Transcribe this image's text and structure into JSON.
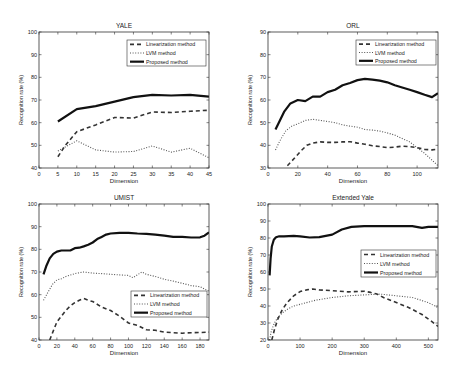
{
  "figure": {
    "legend_labels": [
      "Linearization method",
      "LVM method",
      "Proposed method"
    ],
    "ylabel": "Recognition rate (%)",
    "xlabel": "Dimension"
  },
  "chart_data": [
    {
      "type": "line",
      "title": "YALE",
      "xlabel": "Dimension",
      "ylabel": "Recognition rate (%)",
      "xlim": [
        0,
        45
      ],
      "ylim": [
        40,
        100
      ],
      "xticks": [
        0,
        5,
        10,
        15,
        20,
        25,
        30,
        35,
        40,
        45
      ],
      "yticks": [
        40,
        50,
        60,
        70,
        80,
        90,
        100
      ],
      "grid": false,
      "legend_position": "upper right",
      "box": {
        "left": 39,
        "top": 32,
        "right": 209,
        "bottom": 168
      },
      "legend_box": {
        "x": 127,
        "y": 40,
        "w": 79,
        "h": 26
      },
      "series": [
        {
          "name": "Linearization method",
          "style": "dashed",
          "x": [
            5,
            7,
            10,
            15,
            20,
            25,
            30,
            35,
            40,
            45
          ],
          "y": [
            45,
            50,
            56,
            59,
            62.3,
            62,
            64.7,
            64.5,
            65,
            65.5
          ]
        },
        {
          "name": "LVM method",
          "style": "dotted",
          "x": [
            5,
            10,
            15,
            20,
            25,
            30,
            35,
            40,
            45
          ],
          "y": [
            47.5,
            52,
            48,
            47,
            47.3,
            49.7,
            47,
            48.7,
            44.5
          ]
        },
        {
          "name": "Proposed method",
          "style": "solid",
          "x": [
            5,
            10,
            15,
            20,
            25,
            30,
            35,
            40,
            45
          ],
          "y": [
            60.5,
            66,
            67.3,
            69.3,
            71.3,
            72.3,
            72,
            72.3,
            71.5
          ]
        }
      ]
    },
    {
      "type": "line",
      "title": "ORL",
      "xlabel": "Dimension",
      "ylabel": "Recognition rate (%)",
      "xlim": [
        0,
        114
      ],
      "ylim": [
        30,
        90
      ],
      "xticks": [
        0,
        20,
        40,
        60,
        80,
        100
      ],
      "yticks": [
        30,
        40,
        50,
        60,
        70,
        80,
        90
      ],
      "grid": false,
      "legend_position": "upper right",
      "box": {
        "left": 268,
        "top": 32,
        "right": 438,
        "bottom": 168
      },
      "legend_box": {
        "x": 356,
        "y": 40,
        "w": 80,
        "h": 25
      },
      "series": [
        {
          "name": "Linearization method",
          "style": "dashed",
          "x": [
            13,
            18,
            22,
            26,
            30,
            35,
            40,
            45,
            50,
            55,
            60,
            65,
            70,
            75,
            80,
            85,
            90,
            95,
            100,
            105,
            110,
            114
          ],
          "y": [
            31,
            34.5,
            37.5,
            40,
            41,
            41.5,
            41.3,
            41.3,
            41.5,
            41.6,
            41,
            40.5,
            39.8,
            39.5,
            39,
            39.2,
            39.6,
            39.4,
            39,
            38.2,
            38,
            38.3
          ]
        },
        {
          "name": "LVM method",
          "style": "dotted",
          "x": [
            5,
            8,
            12,
            16,
            20,
            25,
            30,
            35,
            40,
            45,
            50,
            55,
            60,
            65,
            70,
            75,
            80,
            85,
            90,
            95,
            100,
            105,
            110,
            114
          ],
          "y": [
            38,
            42,
            46.5,
            48.5,
            49.5,
            51,
            51.5,
            51,
            50.5,
            50,
            49,
            48.5,
            48,
            47,
            46.7,
            46.3,
            45.5,
            44.5,
            43,
            41.5,
            39,
            36.5,
            33.5,
            31
          ]
        },
        {
          "name": "Proposed method",
          "style": "solid",
          "x": [
            5,
            8,
            11,
            15,
            20,
            25,
            30,
            35,
            40,
            45,
            50,
            55,
            60,
            65,
            70,
            75,
            80,
            85,
            90,
            95,
            100,
            105,
            110,
            114
          ],
          "y": [
            47,
            51,
            55,
            58.5,
            60,
            59.5,
            61.5,
            61.5,
            63.5,
            64.5,
            66.5,
            67.5,
            68.8,
            69.3,
            69,
            68.5,
            67.8,
            66.5,
            65.5,
            64.5,
            63.5,
            62.3,
            61.3,
            63
          ]
        }
      ]
    },
    {
      "type": "line",
      "title": "UMIST",
      "xlabel": "Dimension",
      "ylabel": "Recognition rate (%)",
      "xlim": [
        0,
        190
      ],
      "ylim": [
        40,
        100
      ],
      "xticks": [
        0,
        20,
        40,
        60,
        80,
        100,
        120,
        140,
        160,
        180
      ],
      "yticks": [
        40,
        50,
        60,
        70,
        80,
        90,
        100
      ],
      "grid": false,
      "legend_position": "lower right",
      "box": {
        "left": 39,
        "top": 204,
        "right": 209,
        "bottom": 340
      },
      "legend_box": {
        "x": 131,
        "y": 291,
        "w": 76,
        "h": 26
      },
      "series": [
        {
          "name": "Linearization method",
          "style": "dashed",
          "x": [
            12,
            16,
            20,
            25,
            30,
            35,
            40,
            45,
            50,
            55,
            60,
            70,
            80,
            90,
            100,
            110,
            120,
            130,
            140,
            150,
            160,
            170,
            180,
            190
          ],
          "y": [
            40,
            44,
            48,
            50.5,
            53,
            55,
            56.5,
            57.5,
            58.3,
            57.5,
            57,
            54.5,
            53,
            50.5,
            47.5,
            46.5,
            44.5,
            44.3,
            43.5,
            43.2,
            43,
            43.2,
            43.3,
            43.5
          ]
        },
        {
          "name": "LVM method",
          "style": "dotted",
          "x": [
            5,
            10,
            15,
            20,
            25,
            30,
            40,
            50,
            60,
            70,
            80,
            90,
            100,
            105,
            115,
            120,
            130,
            140,
            150,
            160,
            170,
            180,
            190
          ],
          "y": [
            57.5,
            61,
            64.5,
            66.5,
            67,
            68,
            69.3,
            70,
            69.5,
            69.3,
            69,
            68.7,
            68.5,
            67.5,
            70,
            69,
            68,
            66.8,
            66,
            65,
            64,
            63.5,
            61.5
          ]
        },
        {
          "name": "Proposed method",
          "style": "solid",
          "x": [
            5,
            8,
            12,
            16,
            20,
            25,
            30,
            35,
            40,
            45,
            50,
            55,
            60,
            65,
            70,
            75,
            80,
            90,
            100,
            110,
            120,
            130,
            140,
            150,
            160,
            170,
            180,
            185,
            190
          ],
          "y": [
            69,
            72.5,
            76,
            78,
            79,
            79.5,
            79.5,
            79.5,
            80.5,
            80.7,
            81.3,
            82,
            83,
            84.5,
            85.5,
            86.5,
            87,
            87.3,
            87.3,
            87,
            86.8,
            86.5,
            86,
            85.5,
            85.5,
            85.2,
            85.3,
            86,
            87.5
          ]
        }
      ]
    },
    {
      "type": "line",
      "title": "Extended Yale",
      "xlabel": "Dimension",
      "ylabel": "Recognition rate (%)",
      "xlim": [
        0,
        530
      ],
      "ylim": [
        20,
        100
      ],
      "xticks": [
        0,
        100,
        200,
        300,
        400,
        500
      ],
      "yticks": [
        20,
        30,
        40,
        50,
        60,
        70,
        80,
        90,
        100
      ],
      "grid": false,
      "legend_position": "center right",
      "box": {
        "left": 268,
        "top": 204,
        "right": 438,
        "bottom": 340
      },
      "legend_box": {
        "x": 361,
        "y": 250,
        "w": 75,
        "h": 27
      },
      "series": [
        {
          "name": "Linearization method",
          "style": "dashed",
          "x": [
            12,
            20,
            30,
            45,
            60,
            80,
            100,
            120,
            140,
            160,
            200,
            250,
            300,
            320,
            340,
            360,
            400,
            440,
            480,
            510,
            530
          ],
          "y": [
            20,
            26,
            32,
            38,
            42,
            46,
            48.5,
            49.5,
            50,
            49.5,
            49,
            48.3,
            48.7,
            48,
            47,
            45,
            42,
            39,
            35,
            31,
            28
          ]
        },
        {
          "name": "LVM method",
          "style": "dotted",
          "x": [
            5,
            10,
            20,
            30,
            45,
            60,
            80,
            100,
            150,
            200,
            250,
            300,
            350,
            400,
            450,
            500,
            530
          ],
          "y": [
            20,
            25,
            30,
            33,
            36,
            38,
            40,
            41,
            43.5,
            45,
            46,
            46.5,
            47,
            46,
            45,
            42,
            39
          ]
        },
        {
          "name": "Proposed method",
          "style": "solid",
          "x": [
            5,
            8,
            12,
            18,
            25,
            35,
            50,
            80,
            100,
            130,
            160,
            200,
            230,
            260,
            300,
            350,
            400,
            450,
            480,
            500,
            530
          ],
          "y": [
            58,
            68,
            75,
            79,
            80.5,
            81,
            81,
            81.3,
            81,
            80.3,
            80.5,
            82,
            85,
            86.5,
            87,
            87,
            87,
            87,
            86,
            86.5,
            86.5
          ]
        }
      ]
    }
  ]
}
